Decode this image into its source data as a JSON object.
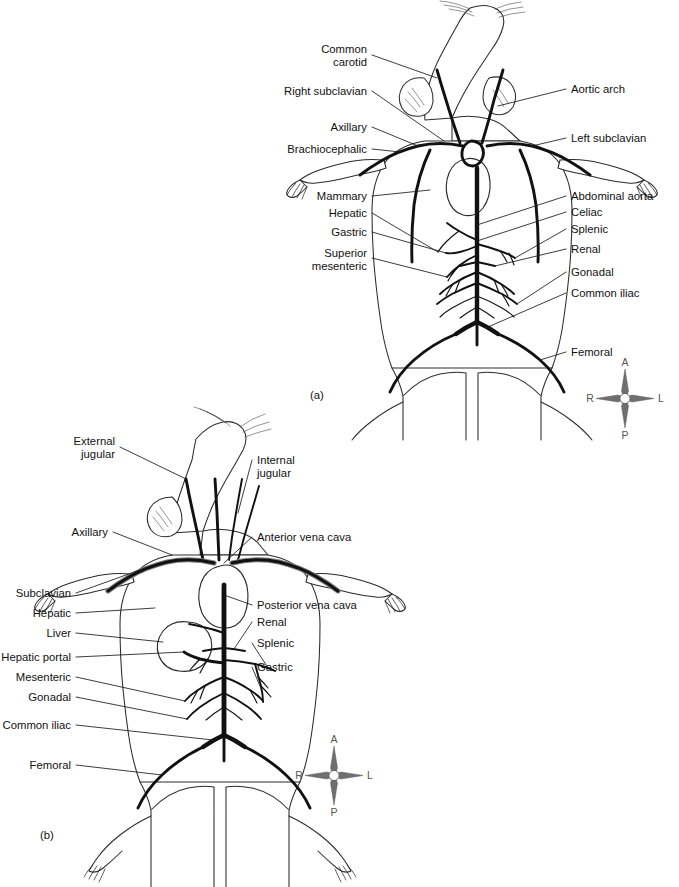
{
  "figure_a": {
    "caption": "(a)",
    "subject": "rat-arterial-system",
    "labels_left": [
      {
        "name": "common-carotid",
        "lines": [
          "Common",
          "carotid"
        ]
      },
      {
        "name": "right-subclavian",
        "lines": [
          "Right subclavian"
        ]
      },
      {
        "name": "axillary",
        "lines": [
          "Axillary"
        ]
      },
      {
        "name": "brachiocephalic",
        "lines": [
          "Brachiocephalic"
        ]
      },
      {
        "name": "mammary",
        "lines": [
          "Mammary"
        ]
      },
      {
        "name": "hepatic",
        "lines": [
          "Hepatic"
        ]
      },
      {
        "name": "gastric",
        "lines": [
          "Gastric"
        ]
      },
      {
        "name": "superior-mesenteric",
        "lines": [
          "Superior",
          "mesenteric"
        ]
      }
    ],
    "labels_right": [
      {
        "name": "aortic-arch",
        "lines": [
          "Aortic arch"
        ]
      },
      {
        "name": "left-subclavian",
        "lines": [
          "Left subclavian"
        ]
      },
      {
        "name": "abdominal-aorta",
        "lines": [
          "Abdominal aorta"
        ]
      },
      {
        "name": "celiac",
        "lines": [
          "Celiac"
        ]
      },
      {
        "name": "splenic",
        "lines": [
          "Splenic"
        ]
      },
      {
        "name": "renal",
        "lines": [
          "Renal"
        ]
      },
      {
        "name": "gonadal",
        "lines": [
          "Gonadal"
        ]
      },
      {
        "name": "common-iliac",
        "lines": [
          "Common iliac"
        ]
      },
      {
        "name": "femoral",
        "lines": [
          "Femoral"
        ]
      }
    ],
    "compass": {
      "north": "A",
      "west": "R",
      "east": "L",
      "south": "P"
    }
  },
  "figure_b": {
    "caption": "(b)",
    "subject": "rat-venous-system",
    "labels_left": [
      {
        "name": "external-jugular",
        "lines": [
          "External",
          "jugular"
        ]
      },
      {
        "name": "axillary",
        "lines": [
          "Axillary"
        ]
      },
      {
        "name": "subclavian",
        "lines": [
          "Subclavian"
        ]
      },
      {
        "name": "hepatic",
        "lines": [
          "Hepatic"
        ]
      },
      {
        "name": "liver",
        "lines": [
          "Liver"
        ]
      },
      {
        "name": "hepatic-portal",
        "lines": [
          "Hepatic portal"
        ]
      },
      {
        "name": "mesenteric",
        "lines": [
          "Mesenteric"
        ]
      },
      {
        "name": "gonadal",
        "lines": [
          "Gonadal"
        ]
      },
      {
        "name": "common-iliac",
        "lines": [
          "Common iliac"
        ]
      },
      {
        "name": "femoral",
        "lines": [
          "Femoral"
        ]
      }
    ],
    "labels_right": [
      {
        "name": "internal-jugular",
        "lines": [
          "Internal",
          "jugular"
        ]
      },
      {
        "name": "anterior-vena-cava",
        "lines": [
          "Anterior vena cava"
        ]
      },
      {
        "name": "posterior-vena-cava",
        "lines": [
          "Posterior vena cava"
        ]
      },
      {
        "name": "renal",
        "lines": [
          "Renal"
        ]
      },
      {
        "name": "splenic",
        "lines": [
          "Splenic"
        ]
      },
      {
        "name": "gastric",
        "lines": [
          "Gastric"
        ]
      }
    ],
    "compass": {
      "north": "A",
      "west": "R",
      "east": "L",
      "south": "P"
    }
  },
  "page_bleed_text": "",
  "colors": {
    "background": "#ffffff",
    "ink": "#111111",
    "outline": "#2b2b2b",
    "vessel_highlight": "#7e7e7e",
    "compass": "#6f6f6f"
  }
}
